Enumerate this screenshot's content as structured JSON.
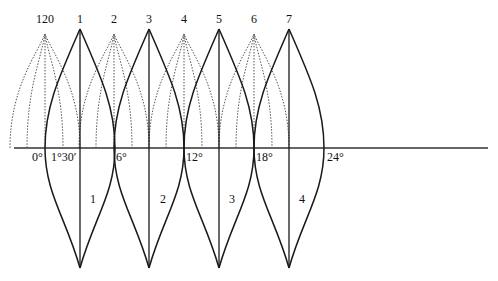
{
  "diagram": {
    "type": "gore-projection",
    "colors": {
      "line": "#1a1a1a",
      "dotted": "#555555",
      "background": "#ffffff"
    },
    "axis": {
      "y": 148,
      "x_start": 14,
      "x_end": 488
    },
    "solid_peaks": [
      {
        "label": "1",
        "x": 80
      },
      {
        "label": "3",
        "x": 149
      },
      {
        "label": "5",
        "x": 219
      },
      {
        "label": "7",
        "x": 289
      }
    ],
    "dotted_peaks": [
      {
        "label": "120",
        "x": 45
      },
      {
        "label": "2",
        "x": 114
      },
      {
        "label": "4",
        "x": 184
      },
      {
        "label": "6",
        "x": 254
      }
    ],
    "degree_labels": [
      {
        "text": "0°",
        "x": 32
      },
      {
        "text": "1°30′",
        "x": 52
      },
      {
        "text": "6°",
        "x": 116
      },
      {
        "text": "12°",
        "x": 186
      },
      {
        "text": "18°",
        "x": 257
      },
      {
        "text": "24°",
        "x": 328
      }
    ],
    "gore_labels": [
      {
        "text": "1",
        "x": 90
      },
      {
        "text": "2",
        "x": 160
      },
      {
        "text": "3",
        "x": 230
      },
      {
        "text": "4",
        "x": 299
      }
    ]
  }
}
